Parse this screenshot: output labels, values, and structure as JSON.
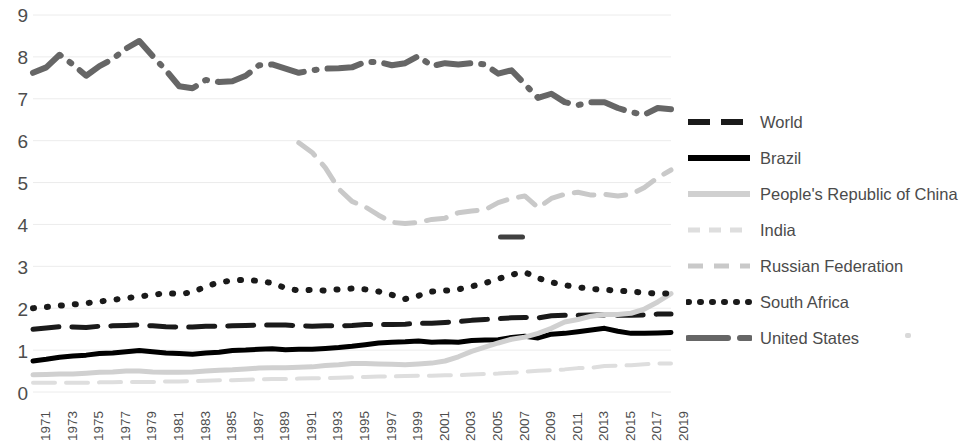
{
  "chart_data": {
    "type": "line",
    "title": "",
    "subtitle": "",
    "xlabel": "",
    "ylabel": "",
    "xlim": [
      1971,
      2019
    ],
    "ylim": [
      0,
      9
    ],
    "yticks": [
      0,
      1,
      2,
      3,
      4,
      5,
      6,
      7,
      8,
      9
    ],
    "grid": true,
    "legend_position": "right",
    "x": [
      1971,
      1972,
      1973,
      1974,
      1975,
      1976,
      1977,
      1978,
      1979,
      1980,
      1981,
      1982,
      1983,
      1984,
      1985,
      1986,
      1987,
      1988,
      1989,
      1990,
      1991,
      1992,
      1993,
      1994,
      1995,
      1996,
      1997,
      1998,
      1999,
      2000,
      2001,
      2002,
      2003,
      2004,
      2005,
      2006,
      2007,
      2008,
      2009,
      2010,
      2011,
      2012,
      2013,
      2014,
      2015,
      2016,
      2017,
      2018,
      2019
    ],
    "xtick_labels": [
      "1971",
      "1973",
      "1975",
      "1977",
      "1979",
      "1981",
      "1983",
      "1985",
      "1987",
      "1989",
      "1991",
      "1993",
      "1995",
      "1997",
      "1999",
      "2001",
      "2003",
      "2005",
      "2007",
      "2009",
      "2011",
      "2013",
      "2015",
      "2017",
      "2019"
    ],
    "series": [
      {
        "name": "World",
        "style": "dashed",
        "color": "#1a1a1a",
        "width": 5,
        "values": [
          1.5,
          1.53,
          1.56,
          1.55,
          1.54,
          1.57,
          1.58,
          1.59,
          1.6,
          1.58,
          1.56,
          1.55,
          1.55,
          1.57,
          1.57,
          1.58,
          1.59,
          1.6,
          1.6,
          1.6,
          1.58,
          1.57,
          1.58,
          1.58,
          1.59,
          1.61,
          1.61,
          1.61,
          1.62,
          1.64,
          1.64,
          1.66,
          1.68,
          1.71,
          1.73,
          1.75,
          1.77,
          1.78,
          1.77,
          1.82,
          1.83,
          1.83,
          1.84,
          1.84,
          1.83,
          1.83,
          1.84,
          1.86,
          1.86
        ]
      },
      {
        "name": "Brazil",
        "style": "solid",
        "color": "#000000",
        "width": 5,
        "values": [
          0.74,
          0.78,
          0.83,
          0.86,
          0.88,
          0.92,
          0.93,
          0.96,
          0.99,
          0.96,
          0.93,
          0.92,
          0.9,
          0.93,
          0.95,
          0.99,
          1.0,
          1.02,
          1.03,
          1.01,
          1.02,
          1.02,
          1.04,
          1.06,
          1.09,
          1.13,
          1.17,
          1.19,
          1.2,
          1.22,
          1.19,
          1.2,
          1.19,
          1.23,
          1.24,
          1.25,
          1.3,
          1.33,
          1.29,
          1.38,
          1.4,
          1.44,
          1.48,
          1.52,
          1.45,
          1.4,
          1.4,
          1.41,
          1.42
        ]
      },
      {
        "name": "People's Republic of China",
        "style": "solid-light",
        "color": "#d0d0d0",
        "width": 5,
        "values": [
          0.41,
          0.42,
          0.43,
          0.43,
          0.45,
          0.47,
          0.48,
          0.5,
          0.5,
          0.48,
          0.47,
          0.47,
          0.48,
          0.5,
          0.52,
          0.53,
          0.55,
          0.57,
          0.58,
          0.58,
          0.59,
          0.6,
          0.63,
          0.65,
          0.68,
          0.68,
          0.67,
          0.66,
          0.65,
          0.67,
          0.69,
          0.74,
          0.84,
          0.97,
          1.07,
          1.17,
          1.26,
          1.31,
          1.4,
          1.52,
          1.67,
          1.73,
          1.81,
          1.85,
          1.85,
          1.88,
          1.98,
          2.15,
          2.35
        ]
      },
      {
        "name": "India",
        "style": "dashed-light",
        "color": "#dedede",
        "width": 4,
        "values": [
          0.22,
          0.22,
          0.22,
          0.22,
          0.22,
          0.23,
          0.23,
          0.24,
          0.24,
          0.24,
          0.25,
          0.25,
          0.26,
          0.27,
          0.28,
          0.28,
          0.29,
          0.3,
          0.31,
          0.31,
          0.32,
          0.33,
          0.33,
          0.34,
          0.35,
          0.36,
          0.37,
          0.37,
          0.38,
          0.39,
          0.39,
          0.4,
          0.4,
          0.42,
          0.43,
          0.44,
          0.46,
          0.48,
          0.51,
          0.52,
          0.54,
          0.57,
          0.58,
          0.62,
          0.63,
          0.64,
          0.66,
          0.68,
          0.68
        ]
      },
      {
        "name": "Russian Federation",
        "style": "dashed-light2",
        "color": "#c9c9c9",
        "width": 5,
        "values": [
          null,
          null,
          null,
          null,
          null,
          null,
          null,
          null,
          null,
          null,
          null,
          null,
          null,
          null,
          null,
          null,
          null,
          null,
          null,
          null,
          5.95,
          5.72,
          5.35,
          4.85,
          4.55,
          4.42,
          4.22,
          4.05,
          4.02,
          4.05,
          4.12,
          4.15,
          4.28,
          4.32,
          4.35,
          4.52,
          4.62,
          4.68,
          4.4,
          4.62,
          4.72,
          4.77,
          4.7,
          4.72,
          4.68,
          4.72,
          4.88,
          5.12,
          5.3
        ]
      },
      {
        "name": "South Africa",
        "style": "dotted",
        "color": "#1a1a1a",
        "width": 6,
        "values": [
          2.0,
          2.03,
          2.06,
          2.09,
          2.12,
          2.16,
          2.2,
          2.24,
          2.28,
          2.32,
          2.36,
          2.34,
          2.38,
          2.52,
          2.62,
          2.66,
          2.68,
          2.65,
          2.6,
          2.48,
          2.42,
          2.44,
          2.42,
          2.45,
          2.47,
          2.45,
          2.4,
          2.32,
          2.22,
          2.3,
          2.4,
          2.42,
          2.45,
          2.52,
          2.6,
          2.7,
          2.8,
          2.86,
          2.72,
          2.62,
          2.55,
          2.5,
          2.46,
          2.44,
          2.42,
          2.4,
          2.37,
          2.35,
          2.35
        ]
      },
      {
        "name": "United States",
        "style": "dashdot",
        "color": "#666666",
        "width": 6,
        "values": [
          7.62,
          7.75,
          8.05,
          7.82,
          7.55,
          7.78,
          7.95,
          8.2,
          8.38,
          8.02,
          7.68,
          7.3,
          7.25,
          7.45,
          7.4,
          7.42,
          7.55,
          7.8,
          7.82,
          7.72,
          7.62,
          7.68,
          7.72,
          7.73,
          7.75,
          7.88,
          7.88,
          7.8,
          7.85,
          8.02,
          7.78,
          7.85,
          7.82,
          7.85,
          7.82,
          7.6,
          7.68,
          7.35,
          7.02,
          7.12,
          6.92,
          6.85,
          6.92,
          6.92,
          6.78,
          6.68,
          6.62,
          6.78,
          6.75
        ]
      }
    ],
    "annotation_marks": [
      {
        "value": 3.7,
        "x": 2007,
        "color": "#404040"
      }
    ]
  },
  "legend": {
    "items": [
      {
        "label": "World",
        "key": "dashed-dark"
      },
      {
        "label": "Brazil",
        "key": "solid-dark"
      },
      {
        "label": "People's Republic of China",
        "key": "solid-light"
      },
      {
        "label": "India",
        "key": "dashed-lightest"
      },
      {
        "label": "Russian Federation",
        "key": "dashed-light"
      },
      {
        "label": "South Africa",
        "key": "dotted-dark"
      },
      {
        "label": "United States",
        "key": "dashdot-gray"
      }
    ]
  }
}
